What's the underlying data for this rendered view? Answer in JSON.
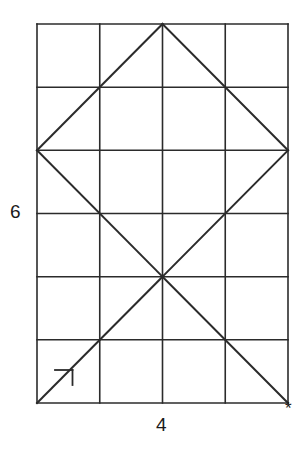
{
  "figure": {
    "title": "",
    "stroke_color": "#2b2b2b",
    "background_color": "#ffffff",
    "stroke_width": 1.6
  },
  "labels": {
    "height_label": "6",
    "width_label": "4",
    "corner_marker": "*"
  },
  "chart_data": {
    "type": "diagram",
    "title": "",
    "xlabel": "4",
    "ylabel": "6",
    "grid": {
      "columns": 4,
      "rows": 6,
      "origin_x": 37,
      "origin_y": 24,
      "cell_width": 62.75,
      "cell_height": 63.17,
      "vertical_line_x": [
        37,
        99.75,
        162.5,
        225.25,
        288
      ],
      "horizontal_line_y": [
        24,
        87.2,
        150.3,
        213.5,
        276.7,
        339.8,
        403
      ]
    },
    "diagonals": [
      {
        "name": "diamond-top-left",
        "x1": 162.5,
        "y1": 24,
        "x2": 37,
        "y2": 150.3
      },
      {
        "name": "diamond-top-right",
        "x1": 162.5,
        "y1": 24,
        "x2": 288,
        "y2": 150.3
      },
      {
        "name": "diamond-bottom-left",
        "x1": 37,
        "y1": 150.3,
        "x2": 162.5,
        "y2": 276.7
      },
      {
        "name": "diamond-bottom-right",
        "x1": 288,
        "y1": 150.3,
        "x2": 162.5,
        "y2": 276.7
      },
      {
        "name": "lower-left-diagonal",
        "x1": 162.5,
        "y1": 276.7,
        "x2": 37,
        "y2": 403
      },
      {
        "name": "lower-right-diagonal",
        "x1": 162.5,
        "y1": 276.7,
        "x2": 288,
        "y2": 403
      }
    ],
    "arrow_marker": {
      "name": "direction-arrowhead",
      "horizontal": {
        "x1": 55,
        "y1": 370,
        "x2": 72.5,
        "y2": 370
      },
      "vertical": {
        "x1": 72.5,
        "y1": 370,
        "x2": 72.5,
        "y2": 385
      }
    },
    "annotations": [
      {
        "text": "6",
        "x": 10,
        "y": 212,
        "role": "vertical-dimension"
      },
      {
        "text": "4",
        "x": 163,
        "y": 425,
        "role": "horizontal-dimension"
      },
      {
        "text": "*",
        "x": 290,
        "y": 408,
        "role": "corner-marker"
      }
    ]
  }
}
